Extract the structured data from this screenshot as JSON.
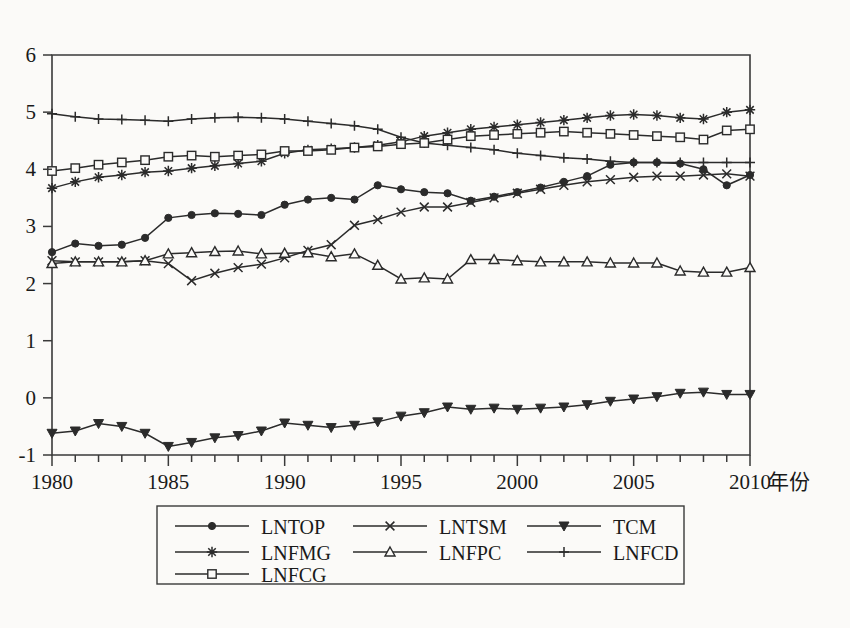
{
  "chart_data": {
    "type": "line",
    "title": "",
    "xlabel": "年份",
    "ylabel": "",
    "xlim": [
      1980,
      2010
    ],
    "ylim": [
      -1,
      6
    ],
    "grid": false,
    "legend_position": "bottom",
    "x_tick_labels": [
      "1980",
      "1985",
      "1990",
      "1995",
      "2000",
      "2005",
      "2010"
    ],
    "x_tick_values": [
      1980,
      1985,
      1990,
      1995,
      2000,
      2005,
      2010
    ],
    "y_tick_labels": [
      "-1",
      "0",
      "1",
      "2",
      "3",
      "4",
      "5",
      "6"
    ],
    "y_tick_values": [
      -1,
      0,
      1,
      2,
      3,
      4,
      5,
      6
    ],
    "x": [
      1980,
      1981,
      1982,
      1983,
      1984,
      1985,
      1986,
      1987,
      1988,
      1989,
      1990,
      1991,
      1992,
      1993,
      1994,
      1995,
      1996,
      1997,
      1998,
      1999,
      2000,
      2001,
      2002,
      2003,
      2004,
      2005,
      2006,
      2007,
      2008,
      2009,
      2010
    ],
    "series": [
      {
        "name": "LNTOP",
        "marker": "filled-circle",
        "values": [
          2.55,
          2.7,
          2.66,
          2.68,
          2.8,
          3.15,
          3.2,
          3.23,
          3.22,
          3.2,
          3.38,
          3.47,
          3.5,
          3.47,
          3.72,
          3.65,
          3.6,
          3.58,
          3.45,
          3.52,
          3.6,
          3.68,
          3.78,
          3.88,
          4.08,
          4.12,
          4.12,
          4.1,
          4.0,
          3.72,
          3.9
        ]
      },
      {
        "name": "LNTSM",
        "marker": "cross-x",
        "values": [
          2.4,
          2.38,
          2.38,
          2.38,
          2.4,
          2.35,
          2.05,
          2.18,
          2.28,
          2.34,
          2.45,
          2.58,
          2.68,
          3.02,
          3.12,
          3.25,
          3.34,
          3.34,
          3.42,
          3.5,
          3.58,
          3.65,
          3.72,
          3.78,
          3.82,
          3.86,
          3.88,
          3.88,
          3.9,
          3.92,
          3.88
        ]
      },
      {
        "name": "TCM",
        "marker": "filled-triangle-down",
        "values": [
          -0.62,
          -0.58,
          -0.45,
          -0.5,
          -0.62,
          -0.85,
          -0.78,
          -0.7,
          -0.66,
          -0.58,
          -0.44,
          -0.48,
          -0.52,
          -0.48,
          -0.42,
          -0.32,
          -0.26,
          -0.16,
          -0.2,
          -0.18,
          -0.2,
          -0.18,
          -0.16,
          -0.12,
          -0.06,
          -0.02,
          0.02,
          0.08,
          0.1,
          0.06,
          0.06
        ]
      },
      {
        "name": "LNFMG",
        "marker": "asterisk",
        "values": [
          3.67,
          3.78,
          3.86,
          3.9,
          3.95,
          3.97,
          4.02,
          4.06,
          4.1,
          4.14,
          4.28,
          4.34,
          4.36,
          4.38,
          4.42,
          4.48,
          4.58,
          4.64,
          4.7,
          4.74,
          4.78,
          4.82,
          4.86,
          4.9,
          4.94,
          4.96,
          4.94,
          4.9,
          4.88,
          5.0,
          5.04
        ]
      },
      {
        "name": "LNFPC",
        "marker": "open-triangle-up",
        "values": [
          2.35,
          2.38,
          2.38,
          2.38,
          2.4,
          2.52,
          2.54,
          2.56,
          2.57,
          2.52,
          2.53,
          2.54,
          2.47,
          2.52,
          2.32,
          2.08,
          2.1,
          2.08,
          2.42,
          2.42,
          2.4,
          2.38,
          2.38,
          2.38,
          2.36,
          2.36,
          2.36,
          2.22,
          2.2,
          2.2,
          2.28
        ]
      },
      {
        "name": "LNFCD",
        "marker": "plus",
        "values": [
          4.97,
          4.92,
          4.88,
          4.87,
          4.86,
          4.84,
          4.88,
          4.9,
          4.91,
          4.9,
          4.88,
          4.84,
          4.8,
          4.76,
          4.7,
          4.56,
          4.46,
          4.42,
          4.38,
          4.34,
          4.28,
          4.24,
          4.2,
          4.18,
          4.14,
          4.12,
          4.12,
          4.12,
          4.12,
          4.12,
          4.12
        ]
      },
      {
        "name": "LNFCG",
        "marker": "open-square",
        "values": [
          3.97,
          4.02,
          4.08,
          4.12,
          4.16,
          4.22,
          4.24,
          4.22,
          4.24,
          4.26,
          4.32,
          4.32,
          4.34,
          4.38,
          4.4,
          4.44,
          4.46,
          4.52,
          4.58,
          4.6,
          4.62,
          4.64,
          4.66,
          4.64,
          4.62,
          4.6,
          4.58,
          4.56,
          4.52,
          4.68,
          4.7
        ]
      }
    ],
    "legend": [
      {
        "label": "LNTOP",
        "marker": "filled-circle"
      },
      {
        "label": "LNTSM",
        "marker": "cross-x"
      },
      {
        "label": "TCM",
        "marker": "filled-triangle-down"
      },
      {
        "label": "LNFMG",
        "marker": "asterisk"
      },
      {
        "label": "LNFPC",
        "marker": "open-triangle-up"
      },
      {
        "label": "LNFCD",
        "marker": "plus"
      },
      {
        "label": "LNFCG",
        "marker": "open-square"
      }
    ],
    "colors": {
      "line": "#2b2b2b",
      "axis": "#3a3a3a",
      "background": "#fbfaf8",
      "text": "#1a1a1a"
    }
  }
}
